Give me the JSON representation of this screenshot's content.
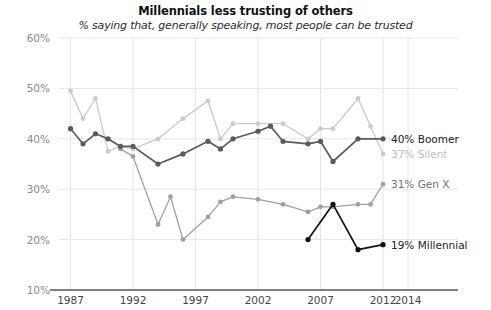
{
  "chart_data": {
    "type": "line",
    "title": "Millennials less trusting of others",
    "subtitle": "% saying that, generally speaking, most people can be trusted",
    "xlabel": "",
    "ylabel": "",
    "xlim": [
      1986,
      2014
    ],
    "ylim": [
      10,
      60
    ],
    "yticks": [
      "10%",
      "20%",
      "30%",
      "40%",
      "50%",
      "60%"
    ],
    "ytick_values": [
      10,
      20,
      30,
      40,
      50,
      60
    ],
    "xticks": [
      "1987",
      "1992",
      "1997",
      "2002",
      "2007",
      "2012",
      "2014"
    ],
    "xtick_values": [
      1987,
      1992,
      1997,
      2002,
      2007,
      2012,
      2014
    ],
    "grid": true,
    "legend_position": "right-inline",
    "series": [
      {
        "name": "Silent",
        "end_label": "37% Silent",
        "color": "#cacaca",
        "x": [
          1987,
          1988,
          1989,
          1990,
          1991,
          1992,
          1994,
          1996,
          1998,
          1999,
          2000,
          2002,
          2004,
          2006,
          2007,
          2008,
          2010,
          2011,
          2012
        ],
        "values": [
          49.5,
          44.0,
          48.0,
          37.5,
          38.5,
          38.0,
          40.0,
          44.0,
          47.5,
          40.0,
          43.0,
          43.0,
          43.0,
          40.0,
          42.0,
          42.0,
          48.0,
          42.5,
          37.0
        ]
      },
      {
        "name": "Boomer",
        "end_label": "40% Boomer",
        "color": "#5a5a5a",
        "x": [
          1987,
          1988,
          1989,
          1990,
          1991,
          1992,
          1994,
          1996,
          1998,
          1999,
          2000,
          2002,
          2003,
          2004,
          2006,
          2007,
          2008,
          2010,
          2012
        ],
        "values": [
          42.0,
          39.0,
          41.0,
          40.0,
          38.5,
          38.5,
          35.0,
          37.0,
          39.5,
          38.0,
          40.0,
          41.5,
          42.5,
          39.5,
          39.0,
          39.5,
          35.5,
          40.0,
          40.0
        ]
      },
      {
        "name": "Gen X",
        "end_label": "31% Gen X",
        "color": "#a0a0a0",
        "x": [
          1991,
          1992,
          1994,
          1995,
          1996,
          1998,
          1999,
          2000,
          2002,
          2004,
          2006,
          2007,
          2008,
          2010,
          2011,
          2012
        ],
        "values": [
          38.0,
          36.5,
          23.0,
          28.5,
          20.0,
          24.5,
          27.5,
          28.5,
          28.0,
          27.0,
          25.5,
          26.5,
          26.5,
          27.0,
          27.0,
          31.0
        ]
      },
      {
        "name": "Millennial",
        "end_label": "19% Millennial",
        "color": "#111111",
        "x": [
          2006,
          2008,
          2010,
          2012
        ],
        "values": [
          20.0,
          27.0,
          18.0,
          19.0
        ]
      }
    ]
  },
  "labels": {
    "boomer": "40% Boomer",
    "silent": "37% Silent",
    "genx": "31% Gen X",
    "millennial": "19% Millennial"
  }
}
